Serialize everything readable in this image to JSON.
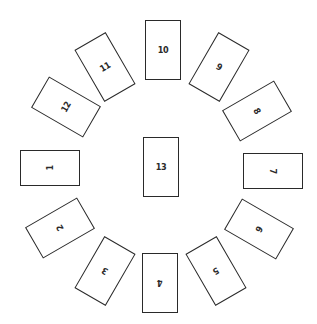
{
  "diagram": {
    "type": "card-spread",
    "layout": "circle-with-center",
    "border_color": "#2a2a2a",
    "background": "#ffffff",
    "cards": [
      {
        "label": "1",
        "cx": 50,
        "cy": 168,
        "rot": 270
      },
      {
        "label": "2",
        "cx": 60,
        "cy": 228,
        "rot": 240
      },
      {
        "label": "3",
        "cx": 105,
        "cy": 271,
        "rot": 210
      },
      {
        "label": "4",
        "cx": 160,
        "cy": 283,
        "rot": 180
      },
      {
        "label": "5",
        "cx": 216,
        "cy": 271,
        "rot": 150
      },
      {
        "label": "6",
        "cx": 259,
        "cy": 229,
        "rot": 120
      },
      {
        "label": "7",
        "cx": 273,
        "cy": 171,
        "rot": 90
      },
      {
        "label": "8",
        "cx": 257,
        "cy": 111,
        "rot": 60
      },
      {
        "label": "9",
        "cx": 219,
        "cy": 67,
        "rot": 30
      },
      {
        "label": "10",
        "cx": 163,
        "cy": 50,
        "rot": 0
      },
      {
        "label": "11",
        "cx": 105,
        "cy": 67,
        "rot": 330
      },
      {
        "label": "12",
        "cx": 66,
        "cy": 107,
        "rot": 300
      },
      {
        "label": "13",
        "cx": 161,
        "cy": 167,
        "rot": 0
      }
    ]
  }
}
